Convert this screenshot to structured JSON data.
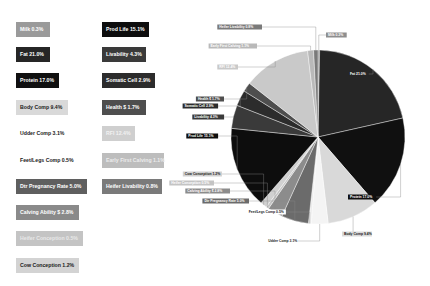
{
  "chart_data": {
    "type": "pie",
    "title": "",
    "unit": "%",
    "categories": [
      "Milk",
      "Fat",
      "Protein",
      "Body Comp",
      "Udder Comp",
      "Feet/Legs Comp",
      "Dtr Pregnancy Rate",
      "Calving Ability $",
      "Heifer Conception",
      "Cow Conception",
      "Prod Life",
      "Livability",
      "Somatic Cell",
      "Health $",
      "RFI",
      "Early First Calving",
      "Heifer Livability"
    ],
    "values": [
      0.3,
      21.0,
      17.0,
      9.4,
      3.1,
      0.5,
      5.0,
      2.8,
      0.5,
      1.2,
      15.1,
      4.3,
      2.9,
      1.7,
      12.4,
      1.1,
      0.8
    ],
    "colors": [
      "#8e8e8e",
      "#262626",
      "#101010",
      "#d9d9d9",
      "#f4f4f4",
      "#ececec",
      "#6b6b6b",
      "#8c8c8c",
      "#c4c4c4",
      "#d0d0d0",
      "#0d0d0d",
      "#3a3a3a",
      "#2c2c2c",
      "#4e4e4e",
      "#c9c9c9",
      "#b9b9b9",
      "#7a7a7a"
    ],
    "label_text_colors": [
      "#ffffff",
      "#ffffff",
      "#ffffff",
      "#1a1a1a",
      "#1a1a1a",
      "#1a1a1a",
      "#ffffff",
      "#ffffff",
      "#ffffff",
      "#1a1a1a",
      "#ffffff",
      "#ffffff",
      "#ffffff",
      "#ffffff",
      "#ffffff",
      "#ffffff",
      "#ffffff"
    ],
    "legend_position": "left",
    "start_angle_deg": 0,
    "direction": "clockwise"
  },
  "legend": {
    "left": [
      {
        "label": "Milk 0.3%",
        "bg": "#9a9a9a",
        "fg": "#ffffff"
      },
      {
        "label": "Fat 21.0%",
        "bg": "#262626",
        "fg": "#ffffff"
      },
      {
        "label": "Protein 17.0%",
        "bg": "#101010",
        "fg": "#ffffff"
      },
      {
        "label": "Body Comp 9.4%",
        "bg": "#d9d9d9",
        "fg": "#1a1a1a"
      },
      {
        "label": "Udder Comp 3.1%",
        "bg": "#ffffff",
        "fg": "#1a1a1a"
      },
      {
        "label": "Feet/Legs Comp 0.5%",
        "bg": "#ffffff",
        "fg": "#1a1a1a"
      },
      {
        "label": "Dtr Pregnancy Rate 5.0%",
        "bg": "#5f5f5f",
        "fg": "#ffffff"
      },
      {
        "label": "Calving Ability $ 2.8%",
        "bg": "#8a8a8a",
        "fg": "#ffffff"
      },
      {
        "label": "Heifer Conception 0.5%",
        "bg": "#c4c4c4",
        "fg": "#e8e8e8"
      },
      {
        "label": "Cow Conception 1.2%",
        "bg": "#d3d3d3",
        "fg": "#1a1a1a"
      }
    ],
    "right": [
      {
        "label": "Prod Life 15.1%",
        "bg": "#0d0d0d",
        "fg": "#ffffff"
      },
      {
        "label": "Livability 4.3%",
        "bg": "#3a3a3a",
        "fg": "#ffffff"
      },
      {
        "label": "Somatic Cell 2.9%",
        "bg": "#2c2c2c",
        "fg": "#ffffff"
      },
      {
        "label": "Health $ 1.7%",
        "bg": "#4e4e4e",
        "fg": "#ffffff"
      },
      {
        "label": "RFI 12.4%",
        "bg": "#cfcfcf",
        "fg": "#f2f2f2"
      },
      {
        "label": "Early First Calving 1.1%",
        "bg": "#bdbdbd",
        "fg": "#ececec"
      },
      {
        "label": "Heifer Livability 0.8%",
        "bg": "#7a7a7a",
        "fg": "#ffffff"
      }
    ]
  },
  "pie_labels": [
    {
      "label": "Milk 0.3%"
    },
    {
      "label": "Fat 21.0%"
    },
    {
      "label": "Protein 17.0%"
    },
    {
      "label": "Body Comp 9.4%"
    },
    {
      "label": "Udder Comp 3.1%"
    },
    {
      "label": "Feet/Legs Comp 0.5%"
    },
    {
      "label": "Dtr Pregnancy Rate 5.0%"
    },
    {
      "label": "Calving Ability $ 2.8%"
    },
    {
      "label": "Heifer Conception 0.5%"
    },
    {
      "label": "Cow Conception 1.2%"
    },
    {
      "label": "Prod Life 15.1%"
    },
    {
      "label": "Livability 4.3%"
    },
    {
      "label": "Somatic Cell 2.9%"
    },
    {
      "label": "Health $ 1.7%"
    },
    {
      "label": "RFI 12.4%"
    },
    {
      "label": "Early First Calving 1.1%"
    },
    {
      "label": "Heifer Livability 0.8%"
    }
  ]
}
